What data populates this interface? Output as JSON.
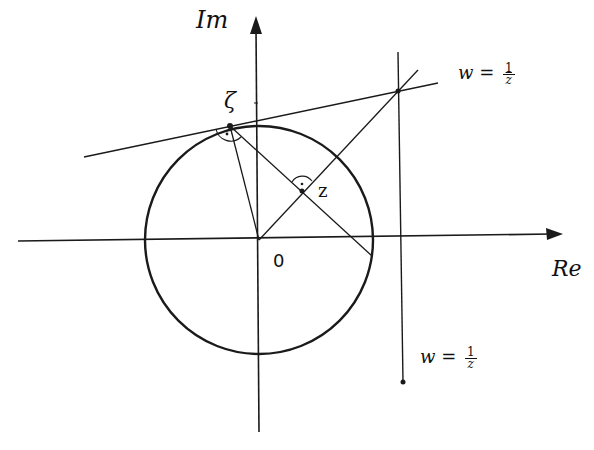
{
  "diagram": {
    "axes": {
      "real_label": "Re",
      "imag_label": "Im",
      "origin_label": "0"
    },
    "points": {
      "zeta_label": "ζ",
      "z_label": "z"
    },
    "lines": {
      "tangent_line": {
        "lhs": "w =",
        "numerator": "1",
        "denominator": "z",
        "denominator_overline": true
      },
      "vertical_line": {
        "lhs": "w =",
        "numerator": "1",
        "denominator": "z",
        "denominator_overline": false
      }
    },
    "colors": {
      "stroke": "#1a1a1a",
      "background": "#ffffff"
    }
  }
}
